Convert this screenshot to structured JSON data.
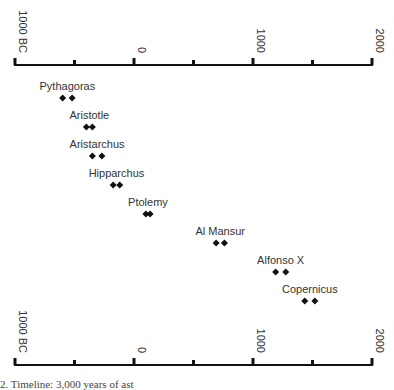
{
  "chart_data": {
    "type": "scatter",
    "title": "",
    "xlabel": "",
    "ylabel": "",
    "xlim": [
      -1000,
      2000
    ],
    "axis_ticks": [
      {
        "value": -1000,
        "label": "1000 BC"
      },
      {
        "value": -500,
        "label": ""
      },
      {
        "value": 0,
        "label": "0"
      },
      {
        "value": 500,
        "label": ""
      },
      {
        "value": 1000,
        "label": "1000"
      },
      {
        "value": 1500,
        "label": ""
      },
      {
        "value": 2000,
        "label": "2000"
      }
    ],
    "grid": false,
    "legend": null,
    "series": [
      {
        "name": "Pythagoras",
        "values": [
          -600,
          -520
        ]
      },
      {
        "name": "Aristotle",
        "values": [
          -400,
          -350
        ]
      },
      {
        "name": "Aristarchus",
        "values": [
          -350,
          -270
        ]
      },
      {
        "name": "Hipparchus",
        "values": [
          -175,
          -120
        ]
      },
      {
        "name": "Ptolemy",
        "values": [
          100,
          135
        ]
      },
      {
        "name": "Al Mansur",
        "values": [
          690,
          760
        ]
      },
      {
        "name": "Alfonso X",
        "values": [
          1190,
          1275
        ]
      },
      {
        "name": "Copernicus",
        "values": [
          1435,
          1520
        ]
      }
    ]
  },
  "caption": "2.  Timeline: 3,000 years of ast"
}
